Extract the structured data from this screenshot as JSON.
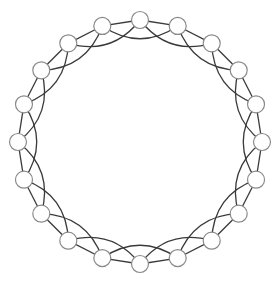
{
  "diagram": {
    "type": "circulant-graph",
    "node_count": 20,
    "connection_offsets": [
      1,
      2
    ],
    "layout": {
      "center": [
        140,
        142
      ],
      "radius": 122,
      "start_angle_deg": -90,
      "node_radius": 8.5,
      "skip_edge_curvature": 0.22
    },
    "colors": {
      "background": "#ffffff",
      "edge": "#3a3a3a",
      "node_fill": "#ffffff",
      "node_stroke": "#8a8a8a"
    }
  }
}
